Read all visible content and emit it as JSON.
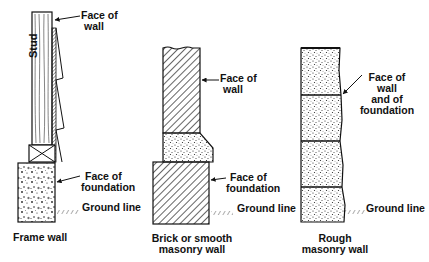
{
  "diagram": {
    "panels": [
      {
        "id": "frame",
        "caption": "Frame wall",
        "labels": {
          "stud": "Stud",
          "face_of_wall": [
            "Face of",
            "wall"
          ],
          "face_of_foundation": [
            "Face of",
            "foundation"
          ],
          "ground_line": "Ground line"
        }
      },
      {
        "id": "brick",
        "caption": [
          "Brick or smooth",
          "masonry wall"
        ],
        "labels": {
          "face_of_wall": [
            "Face of",
            "wall"
          ],
          "face_of_foundation": [
            "Face of",
            "foundation"
          ],
          "ground_line": "Ground line"
        }
      },
      {
        "id": "rough",
        "caption": [
          "Rough",
          "masonry wall"
        ],
        "labels": {
          "face_of_wall_and_foundation": [
            "Face of",
            "wall",
            "and of",
            "foundation"
          ],
          "ground_line": "Ground line"
        }
      }
    ],
    "colors": {
      "ink": "#111111",
      "paper": "#ffffff"
    }
  }
}
